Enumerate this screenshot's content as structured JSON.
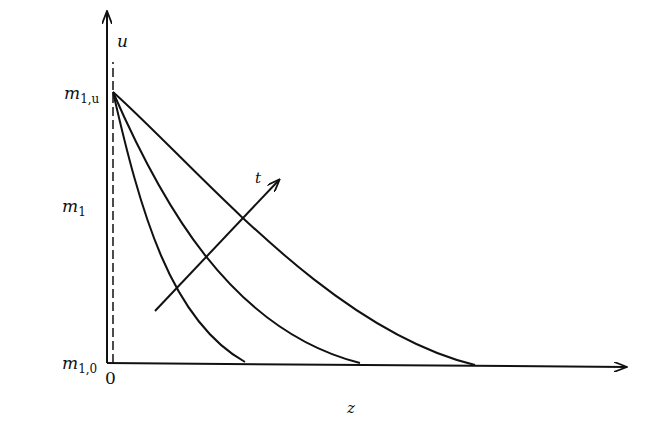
{
  "diagram": {
    "type": "schematic-plot",
    "y_axis": {
      "label": "m",
      "label_sub": "1",
      "top_label": "u"
    },
    "x_axis": {
      "label": "z",
      "origin_label": "0"
    },
    "y_ticks": [
      {
        "label": "m",
        "sub": "1,u"
      },
      {
        "label": "m",
        "sub": "1,0"
      }
    ],
    "curves": [
      {
        "name": "curve-1",
        "end_z_px": 245
      },
      {
        "name": "curve-2",
        "end_z_px": 360
      },
      {
        "name": "curve-3",
        "end_z_px": 475
      }
    ],
    "arrow": {
      "label": "t",
      "meaning": "increasing time"
    },
    "colors": {
      "ink": "#111111",
      "background": "#ffffff"
    }
  }
}
